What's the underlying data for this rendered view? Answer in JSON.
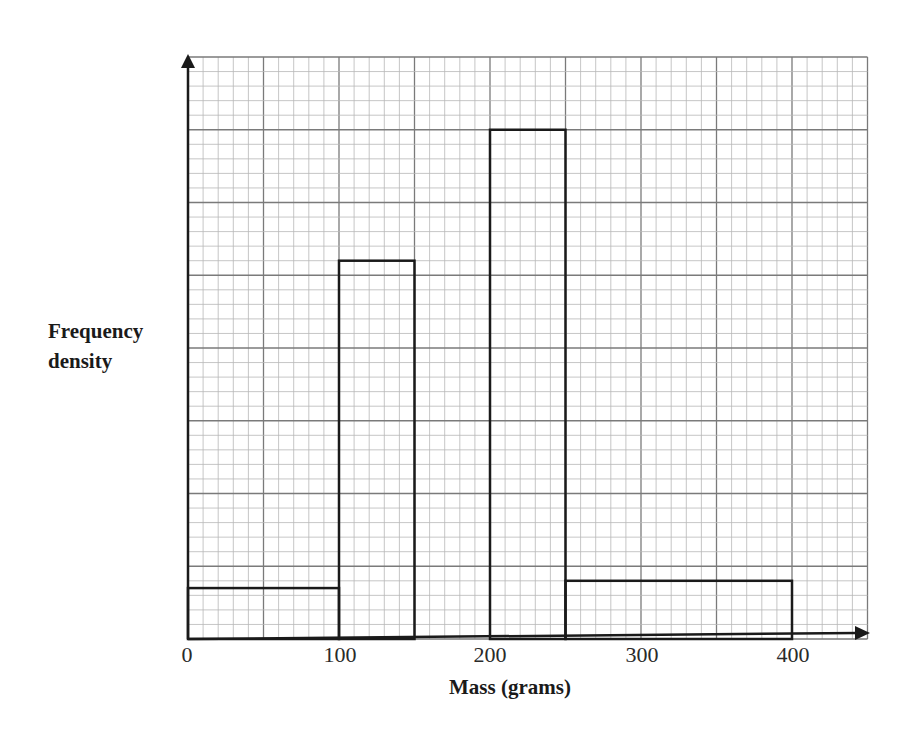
{
  "chart_data": {
    "type": "histogram",
    "title": "",
    "xlabel": "Mass (grams)",
    "ylabel": "Frequency density",
    "x_ticks": [
      "0",
      "100",
      "200",
      "300",
      "400"
    ],
    "x_tick_values": [
      0,
      100,
      200,
      300,
      400
    ],
    "xlim": [
      0,
      450
    ],
    "y_units": "minor grid squares (no numeric scale shown)",
    "ylim": [
      0,
      40
    ],
    "grid": true,
    "grid_minor_x": 10,
    "grid_major_x": 50,
    "grid_minor_y": 1,
    "grid_major_y": 5,
    "bins": [
      {
        "from": 0,
        "to": 100,
        "height": 3.5
      },
      {
        "from": 100,
        "to": 150,
        "height": 26
      },
      {
        "from": 150,
        "to": 200,
        "height": 0
      },
      {
        "from": 200,
        "to": 250,
        "height": 35
      },
      {
        "from": 250,
        "to": 400,
        "height": 4
      }
    ]
  },
  "labels": {
    "ylabel_line1": "Frequency",
    "ylabel_line2": "density",
    "xlabel": "Mass (grams)",
    "ticks": [
      "0",
      "100",
      "200",
      "300",
      "400"
    ]
  },
  "colors": {
    "minor_grid": "#b8b8b8",
    "major_grid": "#7a7a7a",
    "bar_outline": "#1a1a1a",
    "axis": "#1a1a1a"
  }
}
